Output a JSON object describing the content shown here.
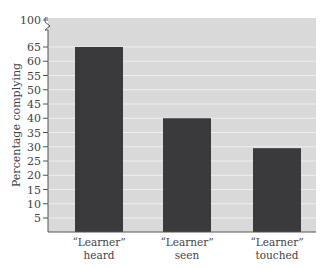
{
  "chart_data": {
    "type": "bar",
    "title": "",
    "xlabel": "",
    "ylabel": "Percentage complying",
    "categories": [
      [
        "“Learner”",
        "heard"
      ],
      [
        "“Learner”",
        "seen"
      ],
      [
        "“Learner”",
        "touched"
      ]
    ],
    "values": [
      65,
      40,
      29.5
    ],
    "yticks": [
      5,
      10,
      15,
      20,
      25,
      30,
      35,
      40,
      45,
      50,
      55,
      60,
      65,
      100
    ],
    "ylim": [
      0,
      100
    ],
    "axis_break": "between 65 and 100",
    "grid": true,
    "legend": null,
    "colors": {
      "bar": "#3a3a3c",
      "plot_bg": "#d9d9d9",
      "grid": "#efefef",
      "axis": "#555555"
    }
  }
}
